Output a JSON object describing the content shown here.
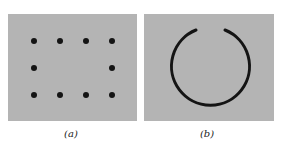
{
  "panels": [
    {
      "id": "a",
      "caption": "(a)",
      "content": "3x4 grid of dots with center two missing"
    },
    {
      "id": "b",
      "caption": "(b)",
      "content": "circle with gap at top"
    }
  ],
  "colors": {
    "panel_bg": "#b4b4b4",
    "ink": "#141414"
  }
}
